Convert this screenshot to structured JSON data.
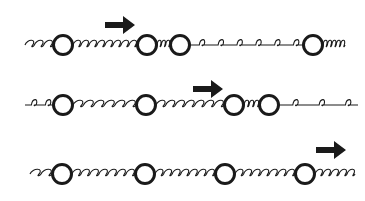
{
  "figure": {
    "stroke_color": "#1a1a1a",
    "background": "#ffffff",
    "rows": [
      {
        "id": "row-1",
        "y": 45,
        "x_start": 25,
        "x_end": 345,
        "masses": [
          63,
          147,
          180,
          313
        ],
        "arrow": {
          "x": 105,
          "y": 25,
          "direction": "right"
        },
        "springs": [
          {
            "from": 25,
            "to": 53,
            "coils": 3,
            "type": "tight"
          },
          {
            "from": 73,
            "to": 137,
            "coils": 8,
            "type": "tight"
          },
          {
            "from": 157,
            "to": 170,
            "coils": 3,
            "type": "compressed"
          },
          {
            "from": 190,
            "to": 303,
            "coils": 6,
            "type": "stretched"
          },
          {
            "from": 323,
            "to": 345,
            "coils": 5,
            "type": "tight"
          }
        ]
      },
      {
        "id": "row-2",
        "y": 105,
        "x_start": 25,
        "x_end": 358,
        "masses": [
          63,
          146,
          234,
          269
        ],
        "arrow": {
          "x": 193,
          "y": 89,
          "direction": "right"
        },
        "springs": [
          {
            "from": 25,
            "to": 53,
            "coils": 2,
            "type": "stretched"
          },
          {
            "from": 73,
            "to": 136,
            "coils": 6,
            "type": "tight"
          },
          {
            "from": 156,
            "to": 224,
            "coils": 7,
            "type": "tight"
          },
          {
            "from": 244,
            "to": 259,
            "coils": 3,
            "type": "compressed"
          },
          {
            "from": 279,
            "to": 358,
            "coils": 3,
            "type": "stretched"
          }
        ]
      },
      {
        "id": "row-3",
        "y": 174,
        "x_start": 30,
        "x_end": 355,
        "masses": [
          62,
          145,
          225,
          305
        ],
        "arrow": {
          "x": 316,
          "y": 150,
          "direction": "right"
        },
        "springs": [
          {
            "from": 30,
            "to": 52,
            "coils": 2,
            "type": "tight"
          },
          {
            "from": 72,
            "to": 135,
            "coils": 7,
            "type": "tight"
          },
          {
            "from": 155,
            "to": 215,
            "coils": 7,
            "type": "tight"
          },
          {
            "from": 235,
            "to": 295,
            "coils": 7,
            "type": "tight"
          },
          {
            "from": 315,
            "to": 355,
            "coils": 5,
            "type": "tight"
          }
        ]
      }
    ]
  }
}
